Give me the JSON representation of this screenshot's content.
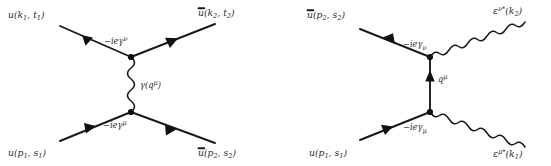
{
  "figure": {
    "background_color": "#ffffff",
    "line_color": "#1a1a1a",
    "text_color": "#2b2b2b",
    "width": 551,
    "height": 166
  },
  "diagrams": [
    {
      "id": "moller-t-channel",
      "name": "electron-electron-scattering-diagram",
      "propagator_type": "photon",
      "labels": {
        "incoming_top": "u(k₁, t₁)",
        "outgoing_top": "ū(k₂, t₂)",
        "incoming_bottom": "u(p₁, s₁)",
        "outgoing_bottom": "ū(p₂, s₂)",
        "vertex_top": "−ieγᵛ",
        "vertex_bottom": "−ieγᵘ",
        "propagator": "γ(qᵘ)"
      },
      "label_parts": {
        "incoming_top": {
          "base": "u(k",
          "sub1": "1",
          "mid": ", t",
          "sub2": "1",
          "end": ")"
        },
        "outgoing_top": {
          "base": "u(k",
          "sub1": "2",
          "mid": ", t",
          "sub2": "2",
          "end": ")",
          "overbar": true
        },
        "incoming_bottom": {
          "base": "u(p",
          "sub1": "1",
          "mid": ", s",
          "sub2": "1",
          "end": ")"
        },
        "outgoing_bottom": {
          "base": "u(p",
          "sub1": "2",
          "mid": ", s",
          "sub2": "2",
          "end": ")",
          "overbar": true
        },
        "vertex_top": {
          "base": "−ieγ",
          "sup": "ν"
        },
        "vertex_bottom": {
          "base": "−ieγ",
          "sup": "μ"
        },
        "propagator": {
          "base": "γ(q",
          "sup": "μ",
          "end": ")"
        }
      }
    },
    {
      "id": "compton-scattering",
      "name": "compton-scattering-diagram",
      "propagator_type": "fermion",
      "labels": {
        "incoming_top": "ū(p₂, s₂)",
        "outgoing_top": "εᵛ*(k₂)",
        "incoming_bottom": "u(p₁, s₁)",
        "outgoing_bottom": "εᵘ*(k₁)",
        "vertex_top": "−ieγᵥ",
        "vertex_bottom": "−ieγᵤ",
        "propagator": "qᵘ"
      },
      "label_parts": {
        "incoming_top": {
          "base": "u(p",
          "sub1": "2",
          "mid": ", s",
          "sub2": "2",
          "end": ")",
          "overbar": true
        },
        "outgoing_top": {
          "base": "ε",
          "sup": "ν*",
          "mid": "(k",
          "sub1": "2",
          "end": ")"
        },
        "incoming_bottom": {
          "base": "u(p",
          "sub1": "1",
          "mid": ", s",
          "sub2": "1",
          "end": ")"
        },
        "outgoing_bottom": {
          "base": "ε",
          "sup": "μ*",
          "mid": "(k",
          "sub1": "1",
          "end": ")"
        },
        "vertex_top": {
          "base": "−ieγ",
          "sub": "ν"
        },
        "vertex_bottom": {
          "base": "−ieγ",
          "sub": "μ"
        },
        "propagator": {
          "base": "q",
          "sup": "μ"
        }
      }
    }
  ]
}
